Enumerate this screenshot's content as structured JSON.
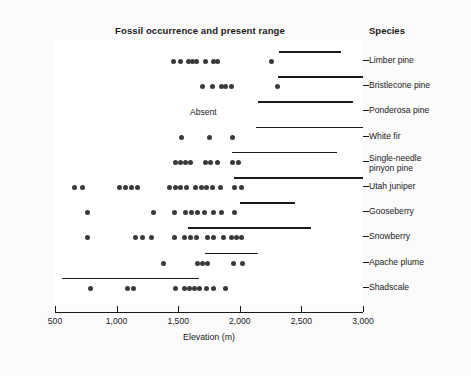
{
  "chart_data": {
    "type": "scatter",
    "title": "Fossil occurrence and present range",
    "xlabel": "Elevation (m)",
    "ylabel": "",
    "xlim": [
      500,
      3000
    ],
    "xticks": [
      500,
      1000,
      1500,
      2000,
      2500,
      3000
    ],
    "xtick_labels": [
      "500",
      "1,000",
      "1,500",
      "2,000",
      "2,500",
      "3,000"
    ],
    "grid": false,
    "legend": "none",
    "column_header": "Species",
    "absent_annotation": "Absent",
    "accent_color": "#1a1a1a",
    "dot_color": "#3a3a3a",
    "series": [
      {
        "name": "Limber pine",
        "fossil_elevations": [
          1460,
          1520,
          1580,
          1620,
          1650,
          1720,
          1790,
          1820,
          2260
        ],
        "present_range": [
          2320,
          2820
        ],
        "fossil_absent": false
      },
      {
        "name": "Bristlecone pine",
        "fossil_elevations": [
          1700,
          1780,
          1850,
          1880,
          1930,
          2310
        ],
        "present_range": [
          2310,
          3000
        ],
        "fossil_absent": false
      },
      {
        "name": "Ponderosa pine",
        "fossil_elevations": [],
        "present_range": [
          2150,
          2920
        ],
        "fossil_absent": true
      },
      {
        "name": "White fir",
        "fossil_elevations": [
          1530,
          1750,
          1940
        ],
        "present_range": [
          2130,
          3000
        ],
        "fossil_absent": false
      },
      {
        "name": "Single-needle\npinyon pine",
        "fossil_elevations": [
          1480,
          1520,
          1560,
          1600,
          1720,
          1760,
          1820,
          1940,
          1990
        ],
        "present_range": [
          1940,
          2790
        ],
        "fossil_absent": false
      },
      {
        "name": "Utah juniper",
        "fossil_elevations": [
          660,
          720,
          1020,
          1070,
          1120,
          1170,
          1430,
          1480,
          1520,
          1570,
          1640,
          1690,
          1730,
          1780,
          1840,
          1960,
          2010
        ],
        "present_range": [
          1950,
          3000
        ],
        "fossil_absent": false
      },
      {
        "name": "Gooseberry",
        "fossil_elevations": [
          760,
          1300,
          1470,
          1560,
          1610,
          1660,
          1710,
          1790,
          1850,
          1960
        ],
        "present_range": [
          2000,
          2450
        ],
        "fossil_absent": false
      },
      {
        "name": "Snowberry",
        "fossil_elevations": [
          760,
          1150,
          1210,
          1280,
          1470,
          1550,
          1600,
          1650,
          1740,
          1790,
          1870,
          1930,
          1970,
          2010
        ],
        "present_range": [
          1580,
          2580
        ],
        "fossil_absent": false
      },
      {
        "name": "Apache plume",
        "fossil_elevations": [
          1380,
          1660,
          1700,
          1740,
          1950,
          2020
        ],
        "present_range": [
          1720,
          2150
        ],
        "fossil_absent": false
      },
      {
        "name": "Shadscale",
        "fossil_elevations": [
          790,
          1090,
          1140,
          1480,
          1550,
          1590,
          1630,
          1670,
          1730,
          1790,
          1880
        ],
        "present_range": [
          560,
          1670
        ],
        "fossil_absent": false
      }
    ]
  }
}
